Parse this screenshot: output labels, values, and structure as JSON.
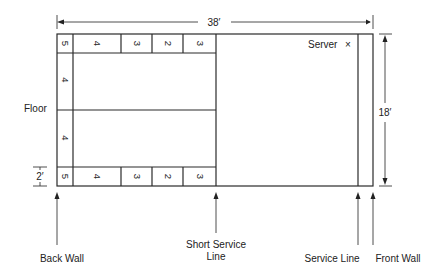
{
  "diagram": {
    "dimensions": {
      "length": "38′",
      "width": "18′",
      "zone_depth": "2′"
    },
    "top_row_cells": [
      "5",
      "4",
      "3",
      "2",
      "3"
    ],
    "bottom_row_cells": [
      "5",
      "4",
      "3",
      "2",
      "3"
    ],
    "side_cells": [
      "4",
      "4"
    ],
    "labels": {
      "floor": "Floor",
      "server": "Server",
      "server_mark": "×",
      "back_wall": "Back Wall",
      "short_service_line_1": "Short Service",
      "short_service_line_2": "Line",
      "service_line": "Service Line",
      "front_wall": "Front Wall"
    }
  }
}
